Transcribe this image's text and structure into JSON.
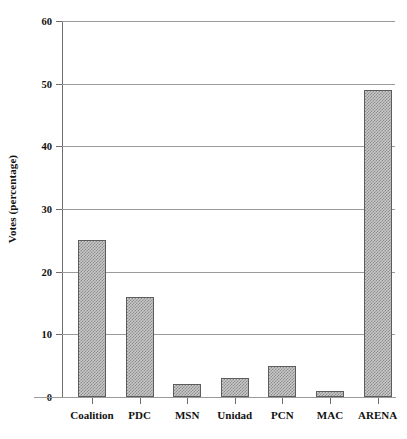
{
  "chart_data": {
    "type": "bar",
    "title": "",
    "subtitle": "",
    "xlabel": "",
    "ylabel": "Votes (percentage)",
    "categories": [
      "Coalition",
      "PDC",
      "MSN",
      "Unidad",
      "PCN",
      "MAC",
      "ARENA"
    ],
    "values": [
      25,
      16,
      2,
      3,
      5,
      1,
      49
    ],
    "ylim": [
      0,
      60
    ],
    "yticks": [
      0,
      10,
      20,
      30,
      40,
      50,
      60
    ],
    "ytick_labels": [
      "0",
      "10",
      "20",
      "30",
      "40",
      "50",
      "60"
    ],
    "grid": true,
    "grid_axis": "y",
    "legend": false,
    "legend_position": "none",
    "bar_fill": "#c9c9c9",
    "bar_pattern": "checkerboard-dither",
    "bar_edge_color": "#5d5d5d",
    "gridline_color": "#9a9a9a",
    "background_color": "#ffffff",
    "text_color": "#111111"
  },
  "axes": {
    "y_title": "Votes (percentage)"
  }
}
